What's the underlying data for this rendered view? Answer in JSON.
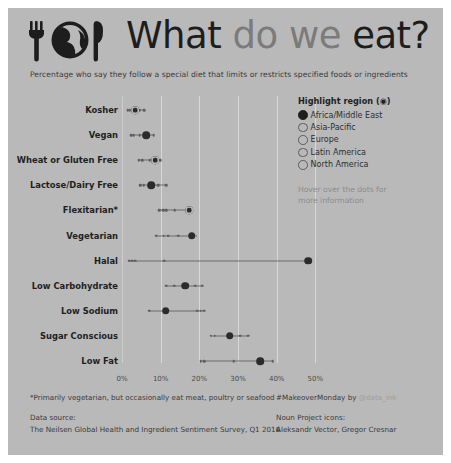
{
  "header": {
    "logo_icon": "fork-globe-knife-icon",
    "title_words": [
      {
        "text": "What",
        "tone": "dark"
      },
      {
        "text": "do",
        "tone": "gray"
      },
      {
        "text": "we",
        "tone": "gray"
      },
      {
        "text": "eat?",
        "tone": "dark"
      }
    ],
    "title_plain": "What do we eat?",
    "subtitle": "Percentage who say they follow a special diet that limits or restricts specified foods or ingredients"
  },
  "legend": {
    "title": "Highlight region (◉)",
    "items": [
      {
        "label": "Africa/Middle East",
        "selected": true
      },
      {
        "label": "Asia-Pacific",
        "selected": false
      },
      {
        "label": "Europe",
        "selected": false
      },
      {
        "label": "Latin America",
        "selected": false
      },
      {
        "label": "North America",
        "selected": false
      }
    ],
    "hint_line1": "Hover over the dots for",
    "hint_line2": "more information"
  },
  "footer": {
    "footnote": "*Primarily vegetarian, but occasionally eat meat, poultry or seafood",
    "source_label": "Data source:",
    "source_text": "The Neilsen Global Health and Ingredient Sentiment Survey, Q1 2016",
    "credit_prefix": "#MakeoverMonday by ",
    "credit_handle": "@data_ink",
    "icons_label": "Noun Project icons:",
    "icons_text": "Aleksandr Vector, Gregor Cresnar"
  },
  "chart_data": {
    "type": "scatter",
    "subtype": "dot-plot-with-range",
    "title": "What do we eat?",
    "subtitle": "Percentage who say they follow a special diet that limits or restricts specified foods or ingredients",
    "xlabel": "",
    "ylabel": "",
    "xlim": [
      0,
      53
    ],
    "xticks": [
      0,
      10,
      20,
      30,
      40,
      50
    ],
    "xticklabels": [
      "0%",
      "10%",
      "20%",
      "30%",
      "40%",
      "50%"
    ],
    "grid": "vertical",
    "legend_position": "right",
    "highlight_region": "Africa/Middle East",
    "categories": [
      "Kosher",
      "Vegan",
      "Wheat or Gluten Free",
      "Lactose/Dairy Free",
      "Flexitarian*",
      "Vegetarian",
      "Halal",
      "Low Carbohydrate",
      "Low Sodium",
      "Sugar Conscious",
      "Low Fat"
    ],
    "series": [
      {
        "name": "Africa/Middle East",
        "values": [
          3.4,
          6.3,
          8.6,
          7.5,
          17.3,
          18.0,
          48.2,
          16.4,
          11.3,
          27.8,
          35.8
        ]
      },
      {
        "name": "Asia-Pacific",
        "values": [
          1.5,
          2.4,
          5.2,
          4.7,
          9.6,
          8.9,
          1.8,
          11.4,
          9.8,
          22.9,
          20.4
        ]
      },
      {
        "name": "Europe",
        "values": [
          2.0,
          3.0,
          4.3,
          5.6,
          10.6,
          10.8,
          2.6,
          13.5,
          7.1,
          24.0,
          21.2
        ]
      },
      {
        "name": "Latin America",
        "values": [
          4.4,
          4.6,
          7.2,
          9.4,
          13.6,
          12.0,
          3.4,
          19.0,
          19.5,
          30.5,
          39.0
        ]
      },
      {
        "name": "North America",
        "values": [
          5.8,
          8.2,
          9.9,
          11.5,
          11.4,
          14.6,
          10.9,
          20.8,
          20.4,
          32.6,
          28.9
        ]
      }
    ],
    "rows": [
      {
        "category": "Kosher",
        "highlight": 3.4,
        "highlight_style": "ring",
        "min": 1.5,
        "max": 5.8,
        "others": [
          1.5,
          2.0,
          4.4,
          5.8
        ]
      },
      {
        "category": "Vegan",
        "highlight": 6.3,
        "highlight_style": "solid",
        "min": 2.4,
        "max": 8.2,
        "others": [
          2.4,
          3.0,
          4.6,
          8.2
        ]
      },
      {
        "category": "Wheat or Gluten Free",
        "highlight": 8.6,
        "highlight_style": "ring",
        "min": 4.3,
        "max": 9.9,
        "others": [
          4.3,
          5.2,
          7.2,
          9.9
        ]
      },
      {
        "category": "Lactose/Dairy Free",
        "highlight": 7.5,
        "highlight_style": "solid",
        "min": 4.7,
        "max": 11.5,
        "others": [
          4.7,
          5.6,
          9.4,
          11.5
        ]
      },
      {
        "category": "Flexitarian*",
        "highlight": 17.3,
        "highlight_style": "ring",
        "min": 9.6,
        "max": 17.3,
        "others": [
          9.6,
          10.6,
          11.4,
          13.6
        ]
      },
      {
        "category": "Vegetarian",
        "highlight": 18.0,
        "highlight_style": "solid",
        "min": 8.9,
        "max": 19.4,
        "others": [
          8.9,
          10.8,
          12.0,
          14.6
        ]
      },
      {
        "category": "Halal",
        "highlight": 48.2,
        "highlight_style": "solid",
        "min": 1.8,
        "max": 48.2,
        "others": [
          1.8,
          2.6,
          3.4,
          10.9
        ]
      },
      {
        "category": "Low Carbohydrate",
        "highlight": 16.4,
        "highlight_style": "solid",
        "min": 11.4,
        "max": 20.8,
        "others": [
          11.4,
          13.5,
          19.0,
          20.8
        ]
      },
      {
        "category": "Low Sodium",
        "highlight": 11.3,
        "highlight_style": "solid",
        "min": 7.1,
        "max": 21.2,
        "others": [
          7.1,
          19.5,
          20.4,
          21.2
        ]
      },
      {
        "category": "Sugar Conscious",
        "highlight": 27.8,
        "highlight_style": "solid",
        "min": 22.9,
        "max": 32.6,
        "others": [
          22.9,
          24.0,
          30.5,
          32.6
        ]
      },
      {
        "category": "Low Fat",
        "highlight": 35.8,
        "highlight_style": "solid",
        "min": 20.4,
        "max": 39.0,
        "others": [
          20.4,
          21.2,
          28.9,
          39.0
        ]
      }
    ]
  }
}
